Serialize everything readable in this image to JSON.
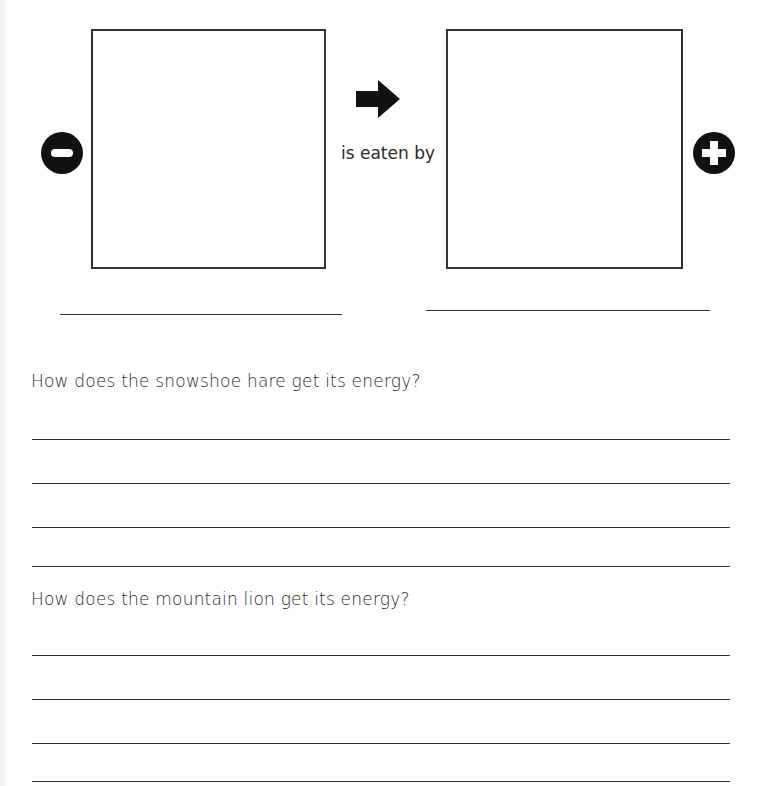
{
  "diagram": {
    "connector_label": "is eaten by",
    "left_icon": "minus-circle-icon",
    "right_icon": "plus-circle-icon",
    "arrow_icon": "arrow-right-icon"
  },
  "questions": [
    {
      "text": "How does the snowshoe hare get its energy?",
      "answer_lines": 4
    },
    {
      "text": "How does the mountain lion get its energy?",
      "answer_lines": 4
    }
  ]
}
